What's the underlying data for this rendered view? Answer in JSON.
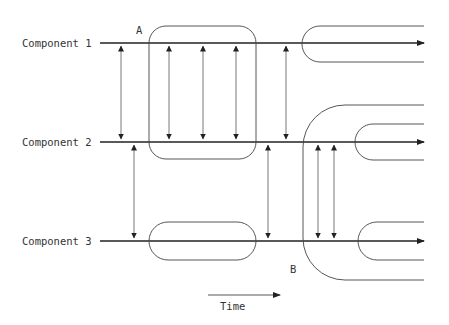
{
  "diagram": {
    "title": "",
    "components": [
      {
        "label": "Component 1",
        "y": 43
      },
      {
        "label": "Component 2",
        "y": 142
      },
      {
        "label": "Component 3",
        "y": 241
      }
    ],
    "markers": {
      "a": "A",
      "b": "B"
    },
    "time_axis": {
      "label": "Time"
    },
    "colors": {
      "line": "#222222",
      "text": "#333333",
      "background": "#ffffff"
    }
  }
}
